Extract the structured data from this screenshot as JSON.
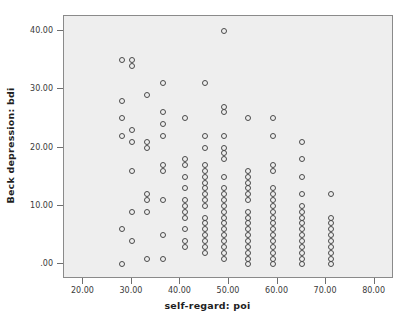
{
  "chart_data": {
    "type": "scatter",
    "title": "",
    "xlabel": "self-regard: poi",
    "ylabel": "Beck depression: bdi",
    "xlim": [
      16,
      84
    ],
    "ylim": [
      -2.5,
      42.5
    ],
    "xticks": [
      20,
      30,
      40,
      50,
      60,
      70,
      80
    ],
    "xticklabels": [
      "20.00",
      "30.00",
      "40.00",
      "50.00",
      "60.00",
      "70.00",
      "80.00"
    ],
    "yticks": [
      0,
      10,
      20,
      30,
      40
    ],
    "yticklabels": [
      ".00",
      "10.00",
      "20.00",
      "30.00",
      "40.00"
    ],
    "grid": false,
    "legend": null,
    "marker": "open-circle",
    "marker_color": "#4a4a4a",
    "plot_background": "#eeeeee",
    "figure_background": "#ffffff",
    "points": [
      [
        28,
        0
      ],
      [
        28,
        6
      ],
      [
        28,
        22
      ],
      [
        28,
        25
      ],
      [
        28,
        28
      ],
      [
        28,
        35
      ],
      [
        30,
        4
      ],
      [
        30,
        9
      ],
      [
        30,
        16
      ],
      [
        30,
        21
      ],
      [
        30,
        23
      ],
      [
        30,
        34
      ],
      [
        30,
        35
      ],
      [
        33,
        1
      ],
      [
        33,
        9
      ],
      [
        33,
        11
      ],
      [
        33,
        12
      ],
      [
        33,
        20
      ],
      [
        33,
        21
      ],
      [
        33,
        29
      ],
      [
        36.5,
        1
      ],
      [
        36.5,
        5
      ],
      [
        36.5,
        11
      ],
      [
        36.5,
        16
      ],
      [
        36.5,
        17
      ],
      [
        36.5,
        22
      ],
      [
        36.5,
        24
      ],
      [
        36.5,
        26
      ],
      [
        36.5,
        31
      ],
      [
        41,
        3
      ],
      [
        41,
        4
      ],
      [
        41,
        6
      ],
      [
        41,
        8
      ],
      [
        41,
        9
      ],
      [
        41,
        10
      ],
      [
        41,
        11
      ],
      [
        41,
        13
      ],
      [
        41,
        15
      ],
      [
        41,
        17
      ],
      [
        41,
        18
      ],
      [
        41,
        25
      ],
      [
        45,
        2
      ],
      [
        45,
        3
      ],
      [
        45,
        4
      ],
      [
        45,
        5
      ],
      [
        45,
        6
      ],
      [
        45,
        7
      ],
      [
        45,
        8
      ],
      [
        45,
        10
      ],
      [
        45,
        11
      ],
      [
        45,
        12
      ],
      [
        45,
        13
      ],
      [
        45,
        14
      ],
      [
        45,
        15
      ],
      [
        45,
        16
      ],
      [
        45,
        17
      ],
      [
        45,
        20
      ],
      [
        45,
        22
      ],
      [
        45,
        31
      ],
      [
        49,
        1
      ],
      [
        49,
        2
      ],
      [
        49,
        3
      ],
      [
        49,
        4
      ],
      [
        49,
        5
      ],
      [
        49,
        6
      ],
      [
        49,
        7
      ],
      [
        49,
        8
      ],
      [
        49,
        9
      ],
      [
        49,
        10
      ],
      [
        49,
        11
      ],
      [
        49,
        12
      ],
      [
        49,
        13
      ],
      [
        49,
        15
      ],
      [
        49,
        18
      ],
      [
        49,
        19
      ],
      [
        49,
        20
      ],
      [
        49,
        22
      ],
      [
        49,
        26
      ],
      [
        49,
        27
      ],
      [
        49,
        40
      ],
      [
        54,
        0
      ],
      [
        54,
        1
      ],
      [
        54,
        2
      ],
      [
        54,
        3
      ],
      [
        54,
        4
      ],
      [
        54,
        5
      ],
      [
        54,
        6
      ],
      [
        54,
        7
      ],
      [
        54,
        8
      ],
      [
        54,
        9
      ],
      [
        54,
        11
      ],
      [
        54,
        12
      ],
      [
        54,
        13
      ],
      [
        54,
        14
      ],
      [
        54,
        15
      ],
      [
        54,
        16
      ],
      [
        54,
        25
      ],
      [
        59,
        0
      ],
      [
        59,
        1
      ],
      [
        59,
        2
      ],
      [
        59,
        3
      ],
      [
        59,
        4
      ],
      [
        59,
        5
      ],
      [
        59,
        6
      ],
      [
        59,
        7
      ],
      [
        59,
        8
      ],
      [
        59,
        9
      ],
      [
        59,
        10
      ],
      [
        59,
        11
      ],
      [
        59,
        12
      ],
      [
        59,
        13
      ],
      [
        59,
        16
      ],
      [
        59,
        17
      ],
      [
        59,
        22
      ],
      [
        59,
        25
      ],
      [
        65,
        0
      ],
      [
        65,
        1
      ],
      [
        65,
        2
      ],
      [
        65,
        3
      ],
      [
        65,
        4
      ],
      [
        65,
        5
      ],
      [
        65,
        6
      ],
      [
        65,
        7
      ],
      [
        65,
        8
      ],
      [
        65,
        9
      ],
      [
        65,
        10
      ],
      [
        65,
        12
      ],
      [
        65,
        15
      ],
      [
        65,
        18
      ],
      [
        65,
        21
      ],
      [
        71,
        0
      ],
      [
        71,
        1
      ],
      [
        71,
        2
      ],
      [
        71,
        3
      ],
      [
        71,
        4
      ],
      [
        71,
        5
      ],
      [
        71,
        6
      ],
      [
        71,
        7
      ],
      [
        71,
        8
      ],
      [
        71,
        12
      ]
    ]
  },
  "axes": {
    "x_title": "self-regard: poi",
    "y_title": "Beck depression: bdi"
  }
}
